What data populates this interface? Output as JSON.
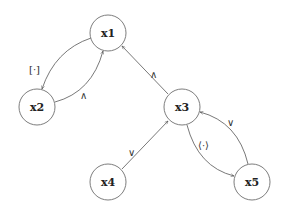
{
  "diagram": {
    "nodes": [
      {
        "id": "x1",
        "label": "x1"
      },
      {
        "id": "x2",
        "label": "x2"
      },
      {
        "id": "x3",
        "label": "x3"
      },
      {
        "id": "x4",
        "label": "x4"
      },
      {
        "id": "x5",
        "label": "x5"
      }
    ],
    "edges": [
      {
        "from": "x1",
        "to": "x2",
        "label": "[·]"
      },
      {
        "from": "x2",
        "to": "x1",
        "label": "∧"
      },
      {
        "from": "x3",
        "to": "x1",
        "label": "∧"
      },
      {
        "from": "x4",
        "to": "x3",
        "label": "∨"
      },
      {
        "from": "x3",
        "to": "x5",
        "label": "⟨·⟩"
      },
      {
        "from": "x5",
        "to": "x3",
        "label": "∨"
      }
    ]
  }
}
